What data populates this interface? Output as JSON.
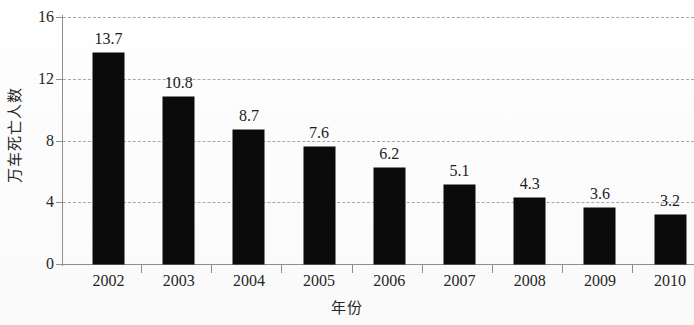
{
  "chart_data": {
    "type": "bar",
    "title": "",
    "xlabel": "年份",
    "ylabel": "万车死亡人数",
    "categories": [
      "2002",
      "2003",
      "2004",
      "2005",
      "2006",
      "2007",
      "2008",
      "2009",
      "2010"
    ],
    "values": [
      13.7,
      10.8,
      8.7,
      7.6,
      6.2,
      5.1,
      4.3,
      3.6,
      3.2
    ],
    "value_labels": [
      "13.7",
      "10.8",
      "8.7",
      "7.6",
      "6.2",
      "5.1",
      "4.3",
      "3.6",
      "3.2"
    ],
    "yticks": [
      0,
      4,
      8,
      12,
      16
    ],
    "ytick_labels": [
      "0",
      "4",
      "8",
      "12",
      "16"
    ],
    "ylim": [
      0,
      16
    ],
    "grid": "horizontal-dashed",
    "legend": "none",
    "series_color": "#0b0b0b",
    "grid_color": "#a8a8a8",
    "axis_color": "#8e8e8e"
  }
}
